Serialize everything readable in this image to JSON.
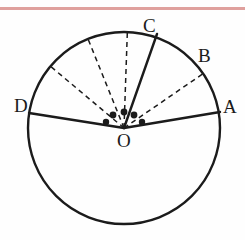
{
  "figure": {
    "background_color": "#fefefe",
    "stroke_color": "#1b1b1b",
    "accent_rule_color": "#d98f8c"
  },
  "labels": {
    "A": "A",
    "B": "B",
    "C": "C",
    "D": "D",
    "O": "O"
  },
  "chart_data": {
    "type": "diagram",
    "circle": {
      "center_x": 124,
      "center_y": 128,
      "radius": 96,
      "stroke_width": 2.4,
      "fill": "none"
    },
    "points": [
      {
        "name": "O",
        "x": 124,
        "y": 128,
        "role": "center"
      },
      {
        "name": "A",
        "x": 220,
        "y": 112,
        "role": "circumference",
        "angle_deg": 9.5
      },
      {
        "name": "B",
        "x": 199,
        "y": 62,
        "role": "circumference",
        "angle_deg": 34.5
      },
      {
        "name": "C",
        "x": 157,
        "y": 34,
        "role": "circumference",
        "angle_deg": 70.0
      },
      {
        "name": "D",
        "x": 29,
        "y": 113,
        "role": "circumference",
        "angle_deg": 171.0
      }
    ],
    "solid_radii": [
      {
        "from": "O",
        "to": "A"
      },
      {
        "from": "O",
        "to": "C"
      },
      {
        "from": "O",
        "to": "D"
      }
    ],
    "dashed_radii": [
      {
        "from": "O",
        "to_angle_deg": 34.5,
        "note": "toward B"
      },
      {
        "from": "O",
        "to_angle_deg": 88.0,
        "note": "unlabeled"
      },
      {
        "from": "O",
        "to_angle_deg": 112.0,
        "note": "unlabeled"
      },
      {
        "from": "O",
        "to_angle_deg": 140.0,
        "note": "unlabeled"
      }
    ],
    "dots": [
      {
        "x": 106,
        "y": 122,
        "r": 3.2
      },
      {
        "x": 113,
        "y": 115,
        "r": 3.4
      },
      {
        "x": 124,
        "y": 112,
        "r": 3.4
      },
      {
        "x": 134,
        "y": 115,
        "r": 3.4
      },
      {
        "x": 142,
        "y": 122,
        "r": 3.2
      }
    ],
    "dot_count": 5,
    "dot_meaning": "ellipsis indicating additional radii between OD and OA"
  }
}
